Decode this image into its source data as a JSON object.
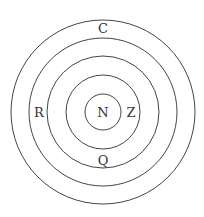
{
  "diagram": {
    "type": "concentric-circles",
    "center": [
      103,
      112
    ],
    "rings": [
      {
        "radius": 92
      },
      {
        "radius": 74
      },
      {
        "radius": 56
      },
      {
        "radius": 37
      },
      {
        "radius": 18
      }
    ],
    "labels": [
      {
        "text": "C",
        "x": 103,
        "y": 33
      },
      {
        "text": "R",
        "x": 39,
        "y": 117
      },
      {
        "text": "N",
        "x": 103,
        "y": 117
      },
      {
        "text": "Z",
        "x": 131,
        "y": 117
      },
      {
        "text": "Q",
        "x": 103,
        "y": 165
      }
    ]
  }
}
